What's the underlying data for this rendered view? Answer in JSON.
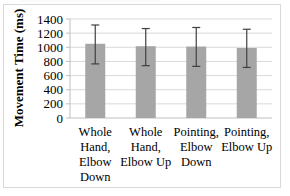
{
  "chart_data": {
    "type": "bar",
    "title": "",
    "xlabel": "",
    "ylabel": "Movement Time (ms)",
    "ylim": [
      0,
      1400
    ],
    "yticks": [
      0,
      200,
      400,
      600,
      800,
      1000,
      1200,
      1400
    ],
    "grid": true,
    "legend": null,
    "categories": [
      "Whole Hand, Elbow Down",
      "Whole Hand, Elbow Up",
      "Pointing, Elbow Down",
      "Pointing, Elbow Up"
    ],
    "category_lines": [
      [
        "Whole",
        "Hand,",
        "Elbow",
        "Down"
      ],
      [
        "Whole",
        "Hand,",
        "Elbow Up"
      ],
      [
        "Pointing,",
        "Elbow",
        "Down"
      ],
      [
        "Pointing,",
        "Elbow Up"
      ]
    ],
    "values": [
      1050,
      1015,
      1010,
      990
    ],
    "error_upper": [
      1315,
      1265,
      1280,
      1255
    ],
    "error_lower": [
      765,
      740,
      730,
      715
    ],
    "colors": {
      "bar": "#a6a6a6",
      "error": "#404040",
      "grid": "#d9d9d9",
      "axis": "#bfbfbf"
    }
  }
}
